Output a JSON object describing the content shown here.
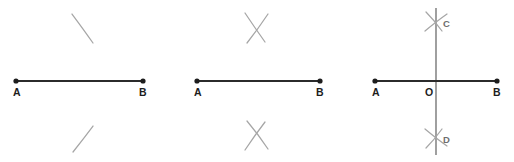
{
  "figure": {
    "background_color": "#ffffff",
    "segment_color": "#2b2b2b",
    "arc_color": "#a6a6a6",
    "perpendicular_color": "#8f8f8f",
    "label_color": "#1d1d1d",
    "soft_label_color": "#6e6e6e",
    "panel_count": 3
  },
  "panels": [
    {
      "id": "panel-1",
      "step": "1",
      "caption": "Segment AB with single arcs drawn above and below",
      "segment": {
        "label": "AB",
        "start": {
          "label": "A",
          "x": 16,
          "y": 81
        },
        "end": {
          "label": "B",
          "x": 143,
          "y": 81
        }
      },
      "labels": [
        {
          "name": "label-a",
          "text": "A",
          "x": 13,
          "y": 96
        },
        {
          "name": "label-b",
          "text": "B",
          "x": 139,
          "y": 96
        }
      ],
      "arcs": [
        {
          "name": "arc-top",
          "position": "above",
          "d": "M 72 14 Q 84 30 93 43"
        },
        {
          "name": "arc-bottom",
          "position": "below",
          "d": "M 73 152 Q 84 138 93 126"
        }
      ]
    },
    {
      "id": "panel-2",
      "step": "2",
      "caption": "Intersecting arc pairs cross above and below segment AB",
      "segment": {
        "label": "AB",
        "start": {
          "label": "A",
          "x": 26,
          "y": 81
        },
        "end": {
          "label": "B",
          "x": 149,
          "y": 81
        }
      },
      "labels": [
        {
          "name": "label-a",
          "text": "A",
          "x": 23,
          "y": 96
        },
        {
          "name": "label-b",
          "text": "B",
          "x": 145,
          "y": 96
        }
      ],
      "arcs": [
        {
          "name": "arc-top-left",
          "position": "above",
          "d": "M 74 13 Q 84 28 94 42"
        },
        {
          "name": "arc-top-right",
          "position": "above",
          "d": "M 97 14 Q 87 29 76 43"
        },
        {
          "name": "arc-bottom-left",
          "position": "below",
          "d": "M 74 150 Q 84 135 94 122"
        },
        {
          "name": "arc-bottom-right",
          "position": "below",
          "d": "M 97 149 Q 87 134 76 121"
        }
      ],
      "intersections": [
        {
          "name": "crossing-above",
          "x": 85,
          "y": 28
        },
        {
          "name": "crossing-below",
          "x": 85,
          "y": 135
        }
      ]
    },
    {
      "id": "panel-3",
      "step": "3",
      "caption": "Line CD through the arc intersections meets AB at O, the midpoint",
      "segment": {
        "label": "AB",
        "start": {
          "label": "A",
          "x": 33,
          "y": 81
        },
        "end": {
          "label": "B",
          "x": 155,
          "y": 81
        }
      },
      "perpendicular": {
        "label": "CD",
        "top": {
          "label": "C",
          "x": 94,
          "y": 8
        },
        "bottom": {
          "label": "D",
          "x": 94,
          "y": 155
        },
        "intersection": {
          "label": "O",
          "x": 94,
          "y": 81
        }
      },
      "labels": [
        {
          "name": "label-a",
          "text": "A",
          "x": 30,
          "y": 96
        },
        {
          "name": "label-o",
          "text": "O",
          "x": 83,
          "y": 96
        },
        {
          "name": "label-b",
          "text": "B",
          "x": 151,
          "y": 96
        },
        {
          "name": "label-c",
          "text": "C",
          "x": 101,
          "y": 27
        },
        {
          "name": "label-d",
          "text": "D",
          "x": 101,
          "y": 143
        }
      ],
      "arcs": [
        {
          "name": "arc-top-left",
          "position": "above",
          "d": "M 84 12 Q 92 20 100 31"
        },
        {
          "name": "arc-top-right",
          "position": "above",
          "d": "M 105 14 Q 95 21 83 31"
        },
        {
          "name": "arc-bottom-left",
          "position": "below",
          "d": "M 84 148 Q 92 140 100 129"
        },
        {
          "name": "arc-bottom-right",
          "position": "below",
          "d": "M 105 146 Q 95 139 83 129"
        }
      ]
    }
  ]
}
